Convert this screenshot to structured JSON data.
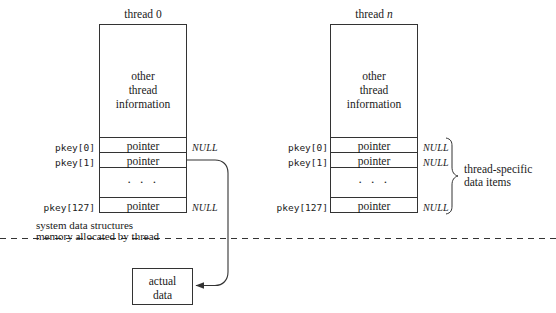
{
  "figure": {
    "type": "diagram",
    "background_color": "#ffffff",
    "stroke_color": "#333333",
    "text_color": "#1a1a1a"
  },
  "threads": [
    {
      "id": "thread0",
      "title_prefix": "thread ",
      "title_suffix": "0",
      "title_suffix_italic": false,
      "info_lines": [
        "other",
        "thread",
        "information"
      ],
      "rows": [
        {
          "key": "pkey[0]",
          "cell": "pointer",
          "null": "NULL"
        },
        {
          "key": "pkey[1]",
          "cell": "pointer",
          "null": ""
        },
        {
          "key": "",
          "cell": "· · ·",
          "null": ""
        },
        {
          "key": "pkey[127]",
          "cell": "pointer",
          "null": "NULL"
        }
      ]
    },
    {
      "id": "threadn",
      "title_prefix": "thread ",
      "title_suffix": "n",
      "title_suffix_italic": true,
      "info_lines": [
        "other",
        "thread",
        "information"
      ],
      "rows": [
        {
          "key": "pkey[0]",
          "cell": "pointer",
          "null": "NULL"
        },
        {
          "key": "pkey[1]",
          "cell": "pointer",
          "null": "NULL"
        },
        {
          "key": "",
          "cell": "· · ·",
          "null": ""
        },
        {
          "key": "pkey[127]",
          "cell": "pointer",
          "null": "NULL"
        }
      ]
    }
  ],
  "brace_annotation": {
    "line1": "thread-specific",
    "line2": "data items"
  },
  "divider_notes": {
    "above": "system data structures",
    "below": "memory allocated by thread"
  },
  "actual_data_box": {
    "line1": "actual",
    "line2": "data"
  }
}
